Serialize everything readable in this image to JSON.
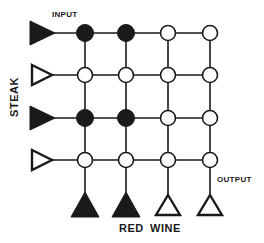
{
  "labels": {
    "input": "INPUT",
    "output": "OUTPUT",
    "steak": "STEAK",
    "red": "RED",
    "wine": "WINE"
  },
  "colors": {
    "ink": "#1a1a1a",
    "background": "#ffffff"
  },
  "grid": {
    "rows": 4,
    "cols": 4,
    "row_y": [
      33,
      75,
      118,
      160
    ],
    "col_x": [
      85,
      126,
      168,
      210
    ],
    "nodes": [
      [
        "filled",
        "filled",
        "open",
        "open"
      ],
      [
        "open",
        "open",
        "open",
        "open"
      ],
      [
        "filled",
        "filled",
        "open",
        "open"
      ],
      [
        "open",
        "open",
        "open",
        "open"
      ]
    ]
  },
  "input_triangles": [
    "filled",
    "open",
    "filled",
    "open"
  ],
  "output_triangles": [
    "filled",
    "filled",
    "open",
    "open"
  ]
}
